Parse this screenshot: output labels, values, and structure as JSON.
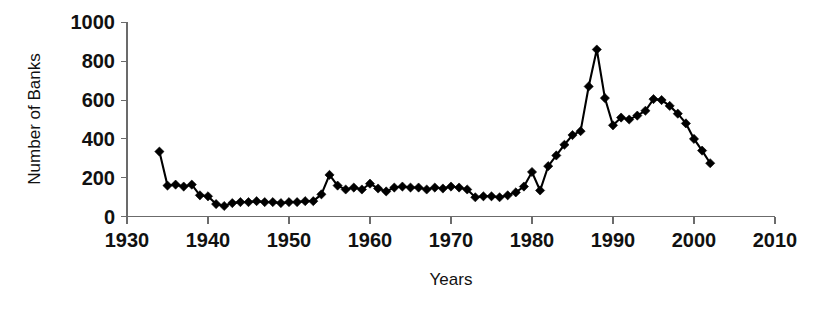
{
  "chart_data": {
    "type": "line",
    "title": "",
    "xlabel": "Years",
    "ylabel": "Number of Banks",
    "xlim": [
      1930,
      2010
    ],
    "ylim": [
      0,
      1000
    ],
    "xticks": [
      1930,
      1940,
      1950,
      1960,
      1970,
      1980,
      1990,
      2000,
      2010
    ],
    "yticks": [
      0,
      200,
      400,
      600,
      800,
      1000
    ],
    "grid": false,
    "legend": false,
    "marker": "diamond",
    "line_color": "#000000",
    "marker_color": "#000000",
    "axis_color": "#6b6b6b",
    "background_color": "#ffffff",
    "x": [
      1934,
      1935,
      1936,
      1937,
      1938,
      1939,
      1940,
      1941,
      1942,
      1943,
      1944,
      1945,
      1946,
      1947,
      1948,
      1949,
      1950,
      1951,
      1952,
      1953,
      1954,
      1955,
      1956,
      1957,
      1958,
      1959,
      1960,
      1961,
      1962,
      1963,
      1964,
      1965,
      1966,
      1967,
      1968,
      1969,
      1970,
      1971,
      1972,
      1973,
      1974,
      1975,
      1976,
      1977,
      1978,
      1979,
      1980,
      1981,
      1982,
      1983,
      1984,
      1985,
      1986,
      1987,
      1988,
      1989,
      1990,
      1991,
      1992,
      1993,
      1994,
      1995,
      1996,
      1997,
      1998,
      1999,
      2000,
      2001,
      2002
    ],
    "values": [
      335,
      160,
      165,
      155,
      165,
      110,
      105,
      65,
      55,
      70,
      75,
      75,
      80,
      75,
      75,
      70,
      75,
      75,
      80,
      80,
      115,
      215,
      160,
      140,
      150,
      140,
      170,
      145,
      130,
      150,
      155,
      150,
      150,
      140,
      150,
      145,
      155,
      150,
      140,
      100,
      105,
      105,
      100,
      110,
      125,
      155,
      230,
      135,
      260,
      315,
      370,
      420,
      440,
      670,
      860,
      610,
      470,
      510,
      500,
      520,
      545,
      605,
      600,
      570,
      530,
      480,
      400,
      340,
      275
    ],
    "series_name": "Number of Banks"
  },
  "axes": {
    "ylabel": "Number of Banks",
    "xlabel": "Years",
    "ytick_labels": [
      "1000",
      "800",
      "600",
      "400",
      "200",
      "0"
    ],
    "xtick_labels": [
      "1930",
      "1940",
      "1950",
      "1960",
      "1970",
      "1980",
      "1990",
      "2000",
      "2010"
    ]
  }
}
